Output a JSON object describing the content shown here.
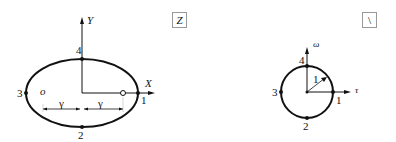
{
  "left_plane": {
    "box_label": "Z",
    "axis_x": "X",
    "axis_y": "Y",
    "points": [
      "1",
      "2",
      "3",
      "4"
    ],
    "focus_left": "o",
    "gamma_left": "γ",
    "gamma_right": "γ"
  },
  "right_plane": {
    "box_label": "\\",
    "axis_x": "τ",
    "axis_y": "ω",
    "radius": "1",
    "points": [
      "1",
      "2",
      "3",
      "4"
    ]
  }
}
